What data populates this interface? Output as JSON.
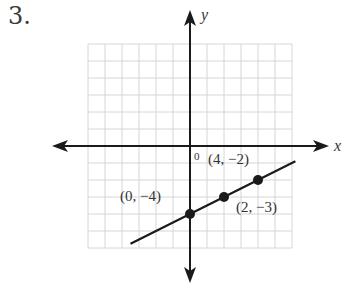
{
  "problem": {
    "number": "3."
  },
  "graph": {
    "axes": {
      "x_label": "x",
      "y_label": "y",
      "origin_label": "0"
    },
    "grid": {
      "x_min": -6,
      "x_max": 6,
      "y_min": -6,
      "y_max": 6,
      "step": 1
    },
    "line": {
      "slope": 0.5,
      "intercept": -4,
      "x_from": -3.5,
      "x_to": 6.2
    },
    "points": [
      {
        "x": 0,
        "y": -4,
        "label": "(0, −4)"
      },
      {
        "x": 2,
        "y": -3,
        "label": "(2, −3)"
      },
      {
        "x": 4,
        "y": -2,
        "label": "(4, −2)"
      }
    ],
    "colors": {
      "grid": "#d6d6d6",
      "axis": "#1a1a1a",
      "line": "#1a1a1a",
      "text": "#333333"
    }
  }
}
